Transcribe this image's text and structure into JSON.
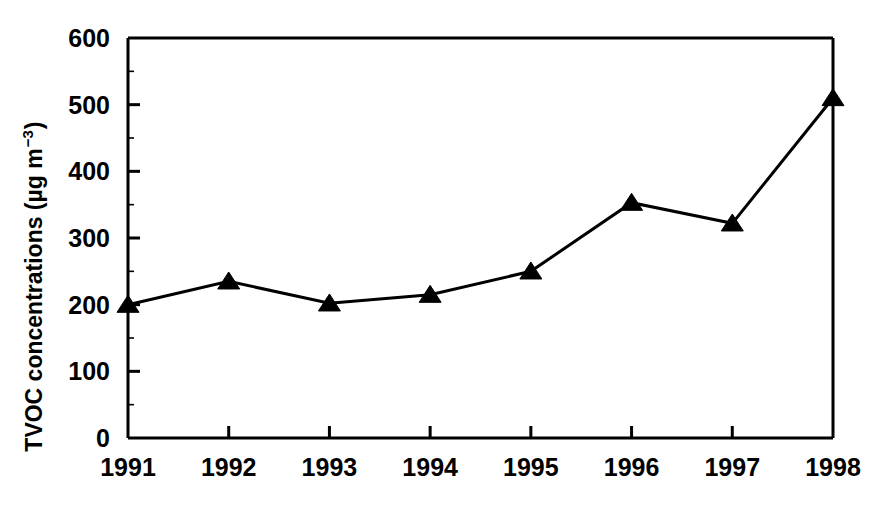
{
  "chart_data": {
    "type": "line",
    "title": "",
    "xlabel": "",
    "ylabel": "TVOC concentrations (µg m",
    "ylabel_exponent": "−3",
    "ylabel_close": ")",
    "categories": [
      "1991",
      "1992",
      "1993",
      "1994",
      "1995",
      "1996",
      "1997",
      "1998"
    ],
    "values": [
      200,
      235,
      202,
      215,
      250,
      353,
      322,
      510
    ],
    "series": [
      {
        "name": "TVOC concentrations",
        "values": [
          200,
          235,
          202,
          215,
          250,
          353,
          322,
          510
        ],
        "marker": "filled-triangle",
        "color": "#000000"
      }
    ],
    "ylim": [
      0,
      600
    ],
    "ytick_labels": [
      "0",
      "100",
      "200",
      "300",
      "400",
      "500",
      "600"
    ],
    "ytick_values": [
      0,
      100,
      200,
      300,
      400,
      500,
      600
    ],
    "yminor_step": 50,
    "xtick_labels": [
      "1991",
      "1992",
      "1993",
      "1994",
      "1995",
      "1996",
      "1997",
      "1998"
    ],
    "grid": false,
    "legend": "none",
    "legend_position": "none",
    "line_color": "#000000",
    "background_color": "#ffffff"
  },
  "axes": {
    "y_axis_name": "y-axis",
    "x_axis_name": "x-axis"
  }
}
